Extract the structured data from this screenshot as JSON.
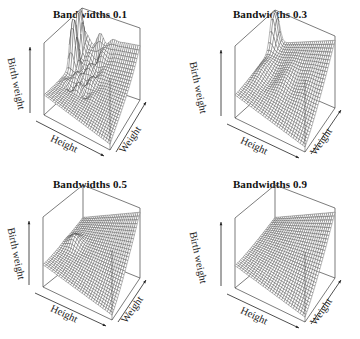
{
  "chart_data": {
    "type": "surface3d",
    "layout": "2x2 grid of perspective wireframe surface plots",
    "panels": [
      {
        "title": "Bandwidths 0.1",
        "bandwidth": 0.1,
        "xlabel": "Height",
        "ylabel": "Weight",
        "zlabel": "Birth weight",
        "description": "Rough surface: sharp twin peaks at back, bumpy middle ridges, rising corner at right",
        "roughness": "high"
      },
      {
        "title": "Bandwidths 0.3",
        "bandwidth": 0.3,
        "xlabel": "Height",
        "ylabel": "Weight",
        "zlabel": "Birth weight",
        "description": "Moderately smooth: single peak at back corner, mild ripples, rising toward right corner",
        "roughness": "medium"
      },
      {
        "title": "Bandwidths 0.5",
        "bandwidth": 0.5,
        "xlabel": "Height",
        "ylabel": "Weight",
        "zlabel": "Birth weight",
        "description": "Smooth near-planar surface with small bump near center-back, rising toward right corner",
        "roughness": "low"
      },
      {
        "title": "Bandwidths 0.9",
        "bandwidth": 0.9,
        "xlabel": "Height",
        "ylabel": "Weight",
        "zlabel": "Birth weight",
        "description": "Very smooth, nearly planar surface increasing toward right corner",
        "roughness": "minimal"
      }
    ]
  },
  "panels": [
    {
      "title": "Bandwidths 0.1",
      "xlabel": "Height",
      "ylabel": "Weight",
      "zlabel": "Birth weight"
    },
    {
      "title": "Bandwidths 0.3",
      "xlabel": "Height",
      "ylabel": "Weight",
      "zlabel": "Birth weight"
    },
    {
      "title": "Bandwidths 0.5",
      "xlabel": "Height",
      "ylabel": "Weight",
      "zlabel": "Birth weight"
    },
    {
      "title": "Bandwidths 0.9",
      "xlabel": "Height",
      "ylabel": "Weight",
      "zlabel": "Birth weight"
    }
  ],
  "colors": {
    "line": "#333333",
    "box": "#444444",
    "background": "#ffffff"
  }
}
